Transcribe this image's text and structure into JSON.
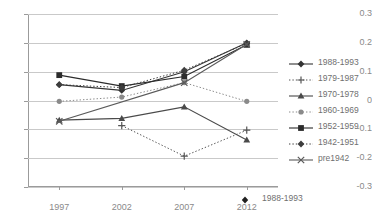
{
  "chart_data": {
    "type": "line",
    "title": "",
    "xlabel": "",
    "ylabel": "",
    "x": [
      "1997",
      "2002",
      "2007",
      "2012"
    ],
    "categories": [
      "1997",
      "2002",
      "2007",
      "2012"
    ],
    "ylim": [
      -0.3,
      0.3
    ],
    "yticks": [
      "0.3",
      "0.2",
      "0.1",
      "0",
      "-0.1",
      "-0.2",
      "-0.3"
    ],
    "ytick_values": [
      0.3,
      0.2,
      0.1,
      0,
      -0.1,
      -0.2,
      -0.3
    ],
    "grid": true,
    "legend_position": "right",
    "series": [
      {
        "name": "1988-1993",
        "marker": "diamond",
        "line": "solid",
        "color": "#333333",
        "values": [
          0.055,
          0.035,
          0.1,
          0.2
        ]
      },
      {
        "name": "1979-1987",
        "marker": "plus",
        "line": "dotted",
        "color": "#555555",
        "values": [
          null,
          -0.087,
          -0.193,
          -0.103
        ]
      },
      {
        "name": "1970-1978",
        "marker": "triangle",
        "line": "solid",
        "color": "#4a4a4a",
        "values": [
          -0.068,
          -0.062,
          -0.022,
          -0.137
        ]
      },
      {
        "name": "1960-1969",
        "marker": "circle",
        "line": "dotted",
        "color": "#8a8a8a",
        "values": [
          -0.003,
          0.012,
          0.062,
          -0.003
        ]
      },
      {
        "name": "1952-1959",
        "marker": "square",
        "line": "solid",
        "color": "#2b2b2b",
        "values": [
          0.088,
          0.05,
          0.083,
          0.193
        ]
      },
      {
        "name": "1942-1951",
        "marker": "diamond",
        "line": "dotted",
        "color": "#3d3d3d",
        "values": [
          0.055,
          0.045,
          0.105,
          0.198
        ]
      },
      {
        "name": "pre1942",
        "marker": "cross",
        "line": "solid",
        "color": "#5a5a5a",
        "values": [
          -0.072,
          null,
          0.062,
          0.195
        ]
      }
    ]
  },
  "legend": {
    "items": [
      {
        "label": "1988-1993"
      },
      {
        "label": "1979-1987"
      },
      {
        "label": "1970-1978"
      },
      {
        "label": "1960-1969"
      },
      {
        "label": "1952-1959"
      },
      {
        "label": "1942-1951"
      },
      {
        "label": "pre1942"
      }
    ]
  },
  "stray_legend": {
    "label": "1988-1993",
    "marker": "diamond"
  },
  "colors": {
    "grid": "#c9c9c9",
    "axis": "#9b9b9b",
    "text": "#8a8a8a",
    "background": "#ffffff"
  }
}
